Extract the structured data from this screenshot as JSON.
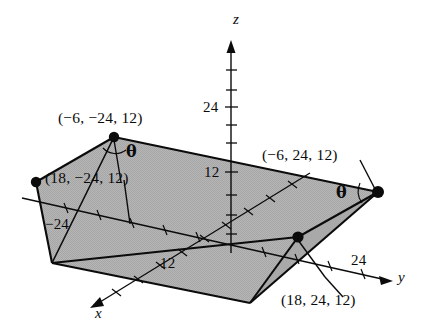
{
  "figure": {
    "type": "3d-coordinate-diagram",
    "colors": {
      "ink": "#0b0b0b",
      "shading": "#b3b3b3",
      "shading_dark": "#a3a3a3",
      "background": "#ffffff"
    },
    "axes": [
      {
        "name": "z-axis",
        "label": "z",
        "direction": "up"
      },
      {
        "name": "y-axis",
        "label": "y",
        "direction": "right"
      },
      {
        "name": "x-axis",
        "label": "x",
        "direction": "lower-left"
      }
    ],
    "tick_labels": [
      {
        "name": "z-tick-24",
        "text": "24",
        "axis": "z",
        "value": 24
      },
      {
        "name": "z-tick-12",
        "text": "12",
        "axis": "z",
        "value": 12
      },
      {
        "name": "y-tick-neg24",
        "text": "−24",
        "axis": "y",
        "value": -24
      },
      {
        "name": "y-tick-24",
        "text": "24",
        "axis": "y",
        "value": 24
      },
      {
        "name": "x-tick-12",
        "text": "12",
        "axis": "x",
        "value": 12
      }
    ],
    "points": [
      {
        "name": "point-neg6-neg24-12",
        "text": "(−6, −24, 12)",
        "coords": [
          -6,
          -24,
          12
        ]
      },
      {
        "name": "point-18-neg24-12",
        "text": "(18, −24, 12)",
        "coords": [
          18,
          -24,
          12
        ]
      },
      {
        "name": "point-neg6-24-12",
        "text": "(−6, 24, 12)",
        "coords": [
          -6,
          24,
          12
        ]
      },
      {
        "name": "point-18-24-12",
        "text": "(18, 24, 12)",
        "coords": [
          18,
          24,
          12
        ]
      }
    ],
    "angles": [
      {
        "name": "theta-left",
        "text": "θ"
      },
      {
        "name": "theta-right",
        "text": "θ"
      }
    ]
  },
  "labels": {
    "axis_z": "z",
    "axis_y": "y",
    "axis_x": "x",
    "z_24": "24",
    "z_12": "12",
    "y_neg24": "−24",
    "y_24": "24",
    "x_12": "12",
    "pt_top_left": "(−6, −24, 12)",
    "pt_mid_left": "(18, −24, 12)",
    "pt_top_right": "(−6, 24, 12)",
    "pt_bottom_right": "(18, 24, 12)",
    "theta_left": "θ",
    "theta_right": "θ"
  }
}
